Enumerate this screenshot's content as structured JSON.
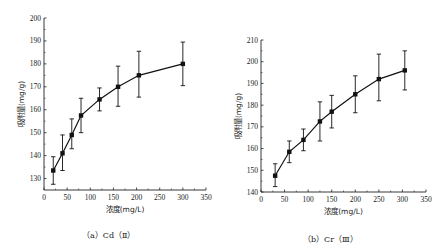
{
  "chart_data": [
    {
      "type": "line",
      "title": "",
      "caption": "（a）Cd（Ⅱ）",
      "xlabel": "浓度(mg/L)",
      "ylabel": "吸附量(mg/g)",
      "xlim": [
        0,
        350
      ],
      "ylim": [
        125,
        200
      ],
      "xticks": [
        0,
        50,
        100,
        150,
        200,
        250,
        300,
        350
      ],
      "yticks": [
        130,
        140,
        150,
        160,
        170,
        180,
        190,
        200
      ],
      "grid": false,
      "legend": null,
      "marker": "square",
      "series": [
        {
          "name": "Cd(II)",
          "x": [
            20,
            40,
            60,
            80,
            120,
            160,
            205,
            300
          ],
          "y": [
            133.5,
            141,
            149,
            157.5,
            164.5,
            170,
            175,
            180
          ],
          "err_low": [
            127.5,
            133.5,
            143,
            150,
            159.5,
            161.5,
            165.5,
            170.5
          ],
          "err_high": [
            139.5,
            149,
            156,
            165,
            169.5,
            179,
            185.5,
            189.5
          ]
        }
      ]
    },
    {
      "type": "line",
      "title": "",
      "caption": "（b）Cr（Ⅲ）",
      "xlabel": "浓度(mg/L)",
      "ylabel": "吸附量(mg/g)",
      "xlim": [
        0,
        350
      ],
      "ylim": [
        140,
        210
      ],
      "xticks": [
        0,
        50,
        100,
        150,
        200,
        250,
        300,
        350
      ],
      "yticks": [
        140,
        150,
        160,
        170,
        180,
        190,
        200,
        210
      ],
      "grid": false,
      "legend": null,
      "marker": "square",
      "series": [
        {
          "name": "Cr(III)",
          "x": [
            30,
            60,
            90,
            125,
            150,
            200,
            250,
            305
          ],
          "y": [
            147.5,
            158.5,
            164,
            172.5,
            177,
            185,
            192,
            196
          ],
          "err_low": [
            142.5,
            153.5,
            159,
            163.5,
            169.5,
            176.5,
            182,
            187
          ],
          "err_high": [
            153,
            163.5,
            169,
            181.5,
            184.5,
            193.5,
            203.5,
            205
          ]
        }
      ]
    }
  ],
  "captions": {
    "left": "（a）Cd（Ⅱ）",
    "right": "（b）Cr（Ⅲ）"
  }
}
